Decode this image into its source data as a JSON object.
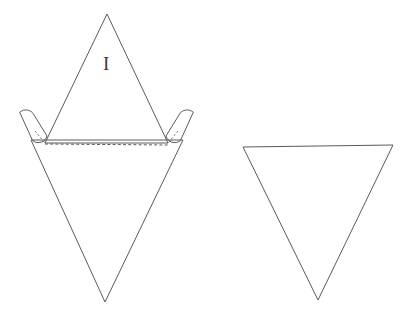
{
  "figure": {
    "background_color": "#ffffff",
    "stroke_color": "#5a5a5a",
    "label_color": "#3a3a3a",
    "width": 413,
    "height": 320,
    "caption": "",
    "parts": [
      {
        "id": "left-net",
        "name": "folded-triangle-net-with-tabs",
        "label": "I",
        "label_x": 103,
        "label_y": 54,
        "upper_triangle": {
          "name": "upward-triangle-face-I",
          "points": "107,14 45,143 168,143"
        },
        "lower_triangle": {
          "name": "downward-triangle-face",
          "points": "31,140 183,140 105,302"
        },
        "fold_line": {
          "name": "dashed-fold-line",
          "x1": 45,
          "y1": 144,
          "x2": 168,
          "y2": 145
        },
        "tabs": [
          {
            "name": "glue-tab-left",
            "path": "M 20,112 A 9,9 0 0 1 34,115 L 47,136 A 9,9 0 0 1 33,141 Z",
            "connector": {
              "x1": 35,
              "y1": 131,
              "x2": 45,
              "y2": 143
            }
          },
          {
            "name": "glue-tab-right",
            "path": "M 193,112 A 9,9 0 0 0 179,115 L 166,136 A 9,9 0 0 0 180,141 Z",
            "connector": {
              "x1": 178,
              "y1": 131,
              "x2": 168,
              "y2": 143
            }
          }
        ]
      },
      {
        "id": "right-triangle",
        "name": "separate-downward-triangle",
        "label": "",
        "triangle": {
          "name": "downward-triangle",
          "points": "243,147 393,145 318,300"
        }
      }
    ]
  }
}
